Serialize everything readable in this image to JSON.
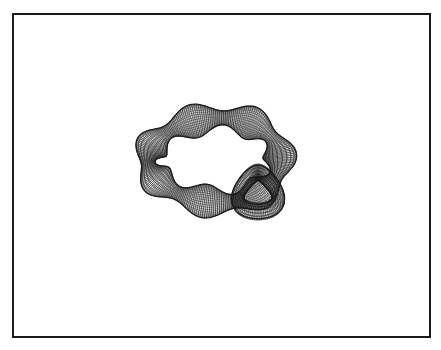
{
  "figure": {
    "frame": {
      "stroke": "#1a1a1a",
      "background": "#ffffff"
    },
    "surface": {
      "kind": "wireframe-knotted-tube",
      "mesh_color": "#1a1a1a",
      "center": [
        214,
        160
      ],
      "ring_radius": [
        66,
        42
      ],
      "lobes": 7,
      "tube_radius_min": 7,
      "tube_radius_max": 17,
      "u_segments": 220,
      "v_segments": 22
    },
    "knot_loop": {
      "center": [
        258,
        192
      ],
      "radius": [
        22,
        26
      ],
      "tube_radius": 8,
      "u_segments": 90,
      "v_segments": 16
    }
  }
}
